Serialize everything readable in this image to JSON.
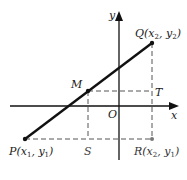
{
  "diagram": {
    "type": "coordinate-geometry",
    "axes": {
      "x_label": "x",
      "y_label": "y",
      "origin_label": "O"
    },
    "points": {
      "P": {
        "name": "P",
        "coords": [
          "x1",
          "y1"
        ]
      },
      "Q": {
        "name": "Q",
        "coords": [
          "x2",
          "y2"
        ]
      },
      "R": {
        "name": "R",
        "coords": [
          "x2",
          "y1"
        ]
      },
      "M": {
        "name": "M"
      },
      "S": {
        "name": "S"
      },
      "T": {
        "name": "T"
      }
    },
    "colors": {
      "segment": "#111111",
      "axes": "#111111",
      "dashed": "#555555"
    }
  }
}
